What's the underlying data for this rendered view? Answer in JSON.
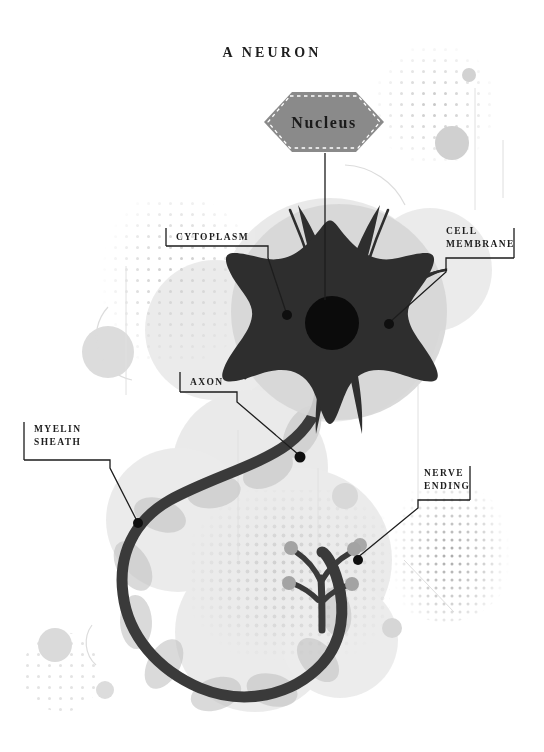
{
  "diagram": {
    "title": "A NEURON",
    "background_color": "#ffffff",
    "ink_color": "#1d1d1d",
    "soma_color": "#2e2e2e",
    "axon_color": "#3a3a3a",
    "accent_gray": "#8a8a8a",
    "pale_gray": "#d9d9d9"
  },
  "nucleus_badge": {
    "label": "Nucleus",
    "shape": "hexagon",
    "fill": "#8a8a8a",
    "border_style": "dashed",
    "border_color": "#ffffff"
  },
  "callouts": [
    {
      "id": "cytoplasm",
      "label": "CYTOPLASM",
      "lines": [
        "CYTOPLASM"
      ],
      "side": "left",
      "target": "cell interior"
    },
    {
      "id": "cell-membrane",
      "label": "CELL MEMBRANE",
      "lines": [
        "CELL",
        "MEMBRANE"
      ],
      "side": "right",
      "target": "soma outer edge"
    },
    {
      "id": "axon",
      "label": "AXON",
      "lines": [
        "AXON"
      ],
      "side": "left",
      "target": "axon fiber"
    },
    {
      "id": "myelin-sheath",
      "label": "MYELIN SHEATH",
      "lines": [
        "MYELIN",
        "SHEATH"
      ],
      "side": "left",
      "target": "myelin segment"
    },
    {
      "id": "nerve-ending",
      "label": "NERVE ENDING",
      "lines": [
        "NERVE",
        "ENDING"
      ],
      "side": "right",
      "target": "axon terminal"
    }
  ],
  "structures": [
    {
      "name": "soma",
      "description": "star shaped cell body"
    },
    {
      "name": "dendrites",
      "description": "eight radiating branches"
    },
    {
      "name": "nucleus-core",
      "description": "black circle at center"
    },
    {
      "name": "axon",
      "description": "long looping fiber"
    },
    {
      "name": "myelin-sheath",
      "description": "pale segments along axon"
    },
    {
      "name": "nerve-endings",
      "description": "branched terminals with knobs"
    }
  ]
}
